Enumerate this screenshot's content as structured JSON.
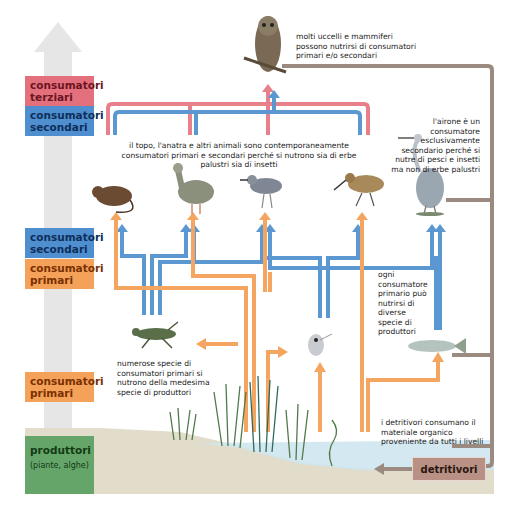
{
  "levels": {
    "terziari": "consumatori terziari",
    "secondari_top": "consumatori secondari",
    "secondari_mid": "consumatori secondari",
    "primari_mid": "consumatori primari",
    "primari_low": "consumatori primari",
    "produttori": "produttori",
    "produttori_sub": "(piante, alghe)"
  },
  "notes": {
    "owl": "molti uccelli e mammiferi possono nutrirsi di consumatori primari e/o secondari",
    "heron": "l'airone è un consumatore esclusivamente secondario perché si nutre di pesci e insetti ma non di erbe palustri",
    "mixed": "il topo, l'anatra e altri animali sono contemporaneamente consumatori primari e secondari perché si nutrono sia di erbe palustri sia di insetti",
    "ogni": "ogni consumatore primario può nutrirsi di diverse specie di produttori",
    "numerose": "numerose specie di consumatori primari si nutrono della medesima specie di produttori",
    "detritivori_note": "i detritivori consumano il materiale organico proveniente da tutti i livelli"
  },
  "detritivori_label": "detritivori",
  "organisms": [
    "gufo",
    "topo",
    "oca",
    "piro-piro",
    "pittima",
    "airone",
    "cavalletta",
    "dafnia",
    "pesce",
    "erbe palustri",
    "alghe"
  ],
  "colors": {
    "terziari": "#e4707e",
    "secondari": "#4f8fcf",
    "primari": "#f4a15a",
    "produttori": "#66a56a",
    "detritivori": "#b89084",
    "arrow_pink": "#e8808c",
    "arrow_blue": "#5b98d2",
    "arrow_orange": "#f4a661",
    "detritus_line": "#9b8a80"
  }
}
